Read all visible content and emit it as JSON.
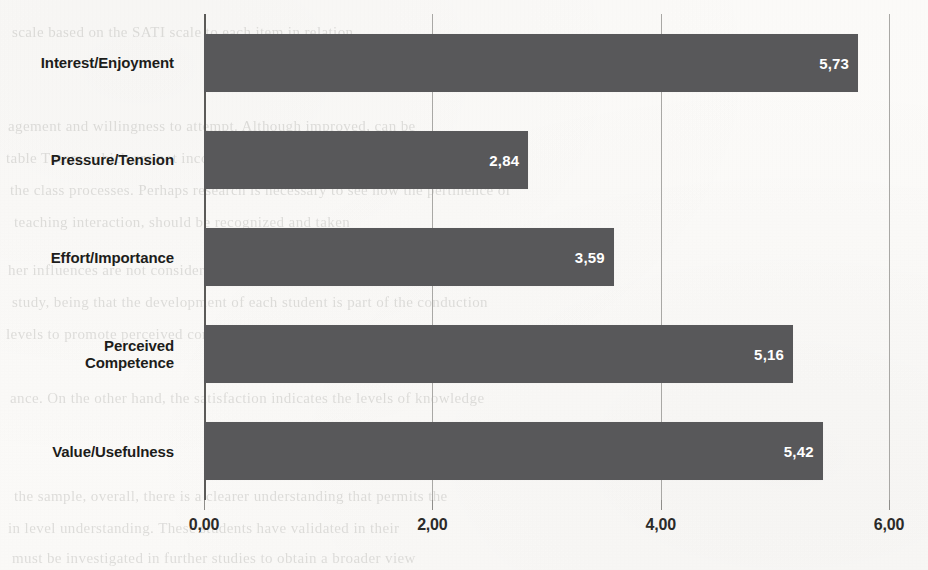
{
  "chart_data": {
    "type": "bar",
    "orientation": "horizontal",
    "title": "",
    "xlabel": "",
    "ylabel": "",
    "xlim": [
      0,
      6
    ],
    "grid": true,
    "legend": "none",
    "categories": [
      "Interest/Enjoyment",
      "Pressure/Tension",
      "Effort/Importance",
      "Perceived\nCompetence",
      "Value/Usefulness"
    ],
    "values": [
      5.73,
      2.84,
      3.59,
      5.16,
      5.42
    ],
    "value_labels": [
      "5,73",
      "2,84",
      "3,59",
      "5,16",
      "5,42"
    ],
    "xticks": [
      0,
      2,
      4,
      6
    ],
    "xtick_labels": [
      "0,00",
      "2,00",
      "4,00",
      "6,00"
    ],
    "bar_color": "#58585a",
    "value_label_color": "#ffffff",
    "axis_color": "#5b5a58",
    "gridline_color": "#a9a8a5"
  },
  "background_ghost_text": [
    "scale based on the SATI scale to each item in relation",
    "agement and willingness to attempt. Although improved, can be",
    "table Tutors, which are not incorporated in a very aggressive way within",
    "the class processes. Perhaps research is necessary to see how the pertinence of",
    "teaching interaction, should be recognized and taken",
    "her influences are not considered in this research, it is plausible that",
    "study, being that the development of each student is part of the conduction",
    "levels to promote perceived competence. Furthermore, the perception of",
    "ance. On the other hand, the satisfaction indicates the levels of knowledge",
    "the sample, overall, there is a clearer understanding that permits the",
    "in level understanding. These students have validated in their",
    "must be investigated in further studies to obtain a broader view"
  ]
}
